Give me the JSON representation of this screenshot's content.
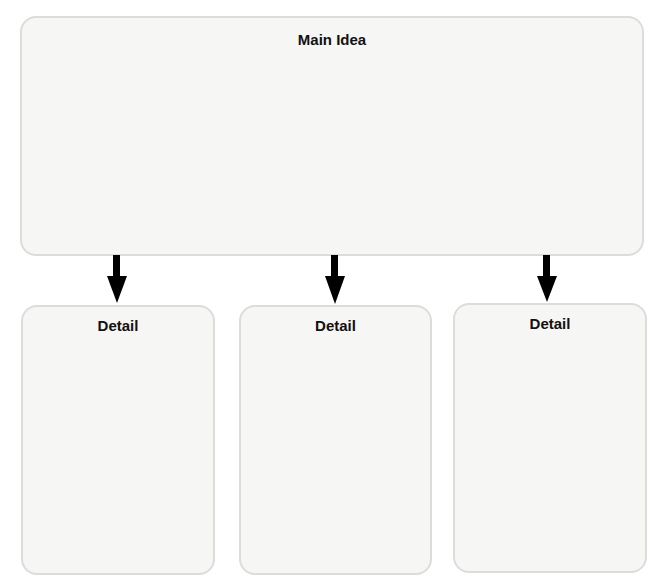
{
  "diagram": {
    "type": "main-idea-and-details organizer",
    "main_idea": {
      "label": "Main Idea"
    },
    "details": [
      {
        "label": "Detail"
      },
      {
        "label": "Detail"
      },
      {
        "label": "Detail"
      }
    ],
    "connections": [
      {
        "from": "main_idea",
        "to": "details.0"
      },
      {
        "from": "main_idea",
        "to": "details.1"
      },
      {
        "from": "main_idea",
        "to": "details.2"
      }
    ],
    "colors": {
      "box_fill": "#f6f6f5",
      "box_border": "#dcdcda",
      "arrow": "#000000",
      "text": "#111111"
    }
  }
}
